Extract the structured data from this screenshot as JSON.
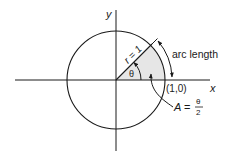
{
  "diagram": {
    "axes": {
      "x_label": "x",
      "y_label": "y"
    },
    "circle": {
      "radius_label": "r = 1"
    },
    "angle_label": "θ",
    "point_label": "(1,0)",
    "arc_label": "arc length",
    "area_label": {
      "lhs": "A",
      "eq": "=",
      "numerator": "θ",
      "denominator": "2"
    },
    "colors": {
      "stroke": "#1a1a1a",
      "sector_fill": "#e6e6e6",
      "background": "#ffffff"
    }
  }
}
